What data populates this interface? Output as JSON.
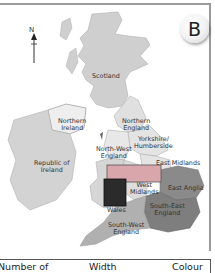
{
  "badge": {
    "letter": "B"
  },
  "compass": {
    "label": "N"
  },
  "regions": {
    "scotland": "Scotland",
    "northern_ireland_1": "Northern",
    "northern_ireland_2": "Ireland",
    "republic_1": "Republic of",
    "republic_2": "Ireland",
    "northern_england_1": "Northern",
    "northern_england_2": "England",
    "yorkshire_1": "Yorkshire/",
    "yorkshire_2": "Humberside",
    "north_west_1": "North-West",
    "north_west_2": "England",
    "east_midlands": "East Midlands",
    "west_midlands_1": "West",
    "west_midlands_2": "Midlands",
    "east_anglia": "East Anglia",
    "south_east_1": "South-East",
    "south_east_2": "England",
    "wales": "Wales",
    "south_west_1": "South-West",
    "south_west_2": "England"
  },
  "colors": {
    "land_light": "#d3d3d3",
    "land_mid": "#a8a8a8",
    "land_dark": "#7e7e7e",
    "overlay_bar": "#d9a7ab",
    "overlay_square": "#2b2b2b",
    "ireland_ni": "#eeeeee"
  },
  "table": {
    "headers": [
      "Number of",
      "Width",
      "Colour"
    ]
  }
}
